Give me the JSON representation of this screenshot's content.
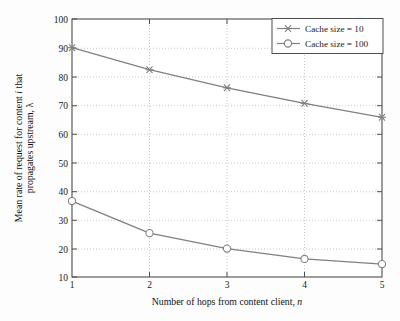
{
  "chart_data": {
    "type": "line",
    "title": "",
    "xlabel": "Number of hops from content client, n",
    "ylabel_line1": "Mean rate of request for content i that",
    "ylabel_line2": "propagates upstream, λ",
    "x": [
      1,
      2,
      3,
      4,
      5
    ],
    "xlim": [
      1,
      5
    ],
    "ylim": [
      10,
      100
    ],
    "xticks": [
      "1",
      "2",
      "3",
      "4",
      "5"
    ],
    "yticks": [
      "10",
      "20",
      "30",
      "40",
      "50",
      "60",
      "70",
      "80",
      "90",
      "100"
    ],
    "grid": true,
    "legend_position": "top-right",
    "series": [
      {
        "name": "Cache size = 10",
        "marker": "star-x",
        "color": "#808080",
        "values": [
          90.0,
          82.3,
          76.0,
          70.6,
          65.7
        ]
      },
      {
        "name": "Cache size = 100",
        "marker": "circle",
        "color": "#808080",
        "values": [
          36.5,
          25.3,
          19.9,
          16.3,
          14.5
        ]
      }
    ]
  },
  "axes": {
    "x_label_prefix": "Number of hops from content client, ",
    "x_label_italic": "n",
    "y_label_part1": "Mean rate of request for content ",
    "y_label_italic": "i",
    "y_label_part2": " that",
    "y_label_line2": "propagates upstream, λ"
  },
  "legend": {
    "entries": [
      {
        "label": "Cache size = 10"
      },
      {
        "label": "Cache size = 100"
      }
    ]
  },
  "colors": {
    "line": "#808080",
    "axis": "#4d4d4d",
    "grid": "#bfbfbf",
    "text": "#1a1a1a",
    "background": "#fdfdfd"
  },
  "ticks": {
    "y": [
      "100",
      "90",
      "80",
      "70",
      "60",
      "50",
      "40",
      "30",
      "20",
      "10"
    ],
    "x": [
      "1",
      "2",
      "3",
      "4",
      "5"
    ]
  }
}
